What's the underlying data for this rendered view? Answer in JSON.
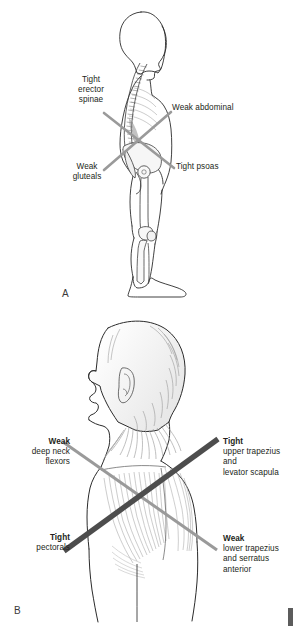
{
  "figure": {
    "background_color": "#ffffff",
    "ink_color": "#231f20",
    "light_line_color": "#9a9a9a",
    "dark_line_color": "#4d4d4d",
    "muscle_shading_color": "#b8b8b8"
  },
  "panel_a": {
    "letter": "A",
    "description": "Lateral view of standing human figure with skeleton showing lower crossed syndrome",
    "cross_lines": [
      {
        "name": "erector-spinae-to-psoas-line",
        "color": "#9a9a9a",
        "direction": "top-left-to-bottom-right"
      },
      {
        "name": "abdominal-to-gluteals-line",
        "color": "#9a9a9a",
        "direction": "top-right-to-bottom-left"
      }
    ],
    "labels": [
      {
        "name": "tight-erector-spinae",
        "align": "center",
        "lines": [
          "Tight",
          "erector",
          "spinae"
        ],
        "bold_first": false
      },
      {
        "name": "weak-abdominal",
        "align": "left",
        "lines": [
          "Weak abdominal"
        ],
        "bold_first": false
      },
      {
        "name": "weak-gluteals",
        "align": "center",
        "lines": [
          "Weak",
          "gluteals"
        ],
        "bold_first": false
      },
      {
        "name": "tight-psoas",
        "align": "left",
        "lines": [
          "Tight psoas"
        ],
        "bold_first": false
      }
    ],
    "label_text": {
      "erector_l1": "Tight",
      "erector_l2": "erector",
      "erector_l3": "spinae",
      "abdominal_l1": "Weak abdominal",
      "gluteals_l1": "Weak",
      "gluteals_l2": "gluteals",
      "psoas_l1": "Tight psoas"
    }
  },
  "panel_b": {
    "letter": "B",
    "description": "Posterior-lateral view of head, neck and upper back showing upper crossed syndrome with trapezius musculature",
    "cross_lines": [
      {
        "name": "tight-pectorals-to-tight-upper-trapezius-line",
        "color": "#4d4d4d",
        "direction": "bottom-left-to-top-right",
        "weight": "thick"
      },
      {
        "name": "weak-deep-neck-flexors-to-weak-lower-trapezius-line",
        "color": "#9a9a9a",
        "direction": "top-left-to-bottom-right",
        "weight": "thin"
      }
    ],
    "labels": [
      {
        "name": "weak-deep-neck-flexors",
        "align": "right",
        "heading": "Weak",
        "lines": [
          "deep neck",
          "flexors"
        ]
      },
      {
        "name": "tight-upper-trapezius",
        "align": "left",
        "heading": "Tight",
        "lines": [
          "upper trapezius",
          "and",
          "levator scapula"
        ]
      },
      {
        "name": "tight-pectorals",
        "align": "right",
        "heading": "Tight",
        "lines": [
          "pectorals"
        ]
      },
      {
        "name": "weak-lower-trapezius",
        "align": "left",
        "heading": "Weak",
        "lines": [
          "lower trapezius",
          "and serratus",
          "anterior"
        ]
      }
    ],
    "label_text": {
      "dnf_head": "Weak",
      "dnf_l1": "deep neck",
      "dnf_l2": "flexors",
      "ut_head": "Tight",
      "ut_l1": "upper trapezius",
      "ut_l2": "and",
      "ut_l3": "levator scapula",
      "pect_head": "Tight",
      "pect_l1": "pectorals",
      "lt_head": "Weak",
      "lt_l1": "lower trapezius",
      "lt_l2": "and serratus",
      "lt_l3": "anterior"
    }
  }
}
